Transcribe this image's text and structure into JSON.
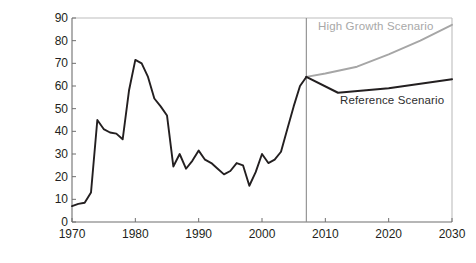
{
  "axes": {
    "ylabel": "dollars per barrel (2006)",
    "yticks": [
      0,
      10,
      20,
      30,
      40,
      50,
      60,
      70,
      80,
      90
    ],
    "xticks": [
      1970,
      1980,
      1990,
      2000,
      2010,
      2020,
      2030
    ]
  },
  "annotations": {
    "high_growth": "High Growth Scenario",
    "reference": "Reference Scenario"
  },
  "colors": {
    "historical_line": "#231f20",
    "reference_line": "#231f20",
    "high_growth_line": "#a6a6a6",
    "frame": "#bdbdbd",
    "divider": "#8c8c8c",
    "text": "#231f20",
    "high_growth_text": "#a8a8a8"
  },
  "chart_data": {
    "type": "line",
    "title": "",
    "xlabel": "",
    "ylabel": "dollars per barrel (2006)",
    "xlim": [
      1970,
      2030
    ],
    "ylim": [
      0,
      90
    ],
    "grid": false,
    "legend": "inline-annotations",
    "divider_year": 2007,
    "series": [
      {
        "name": "Historical",
        "color": "#231f20",
        "x": [
          1970,
          1971,
          1972,
          1973,
          1974,
          1975,
          1976,
          1977,
          1978,
          1979,
          1980,
          1981,
          1982,
          1983,
          1984,
          1985,
          1986,
          1987,
          1988,
          1989,
          1990,
          1991,
          1992,
          1993,
          1994,
          1995,
          1996,
          1997,
          1998,
          1999,
          2000,
          2001,
          2002,
          2003,
          2004,
          2005,
          2006,
          2007
        ],
        "values": [
          7,
          8,
          8.5,
          13,
          45,
          41,
          39.5,
          39,
          36.5,
          58,
          71.5,
          70,
          64,
          54.5,
          51,
          47,
          24.5,
          30,
          23.5,
          27,
          31.5,
          27.5,
          26,
          23.5,
          21,
          22.5,
          26,
          25,
          16,
          22,
          30,
          26,
          27.5,
          31,
          41,
          51,
          60,
          64
        ]
      },
      {
        "name": "Reference Scenario",
        "color": "#231f20",
        "x": [
          2007,
          2012,
          2020,
          2030
        ],
        "values": [
          64,
          57,
          59,
          63
        ]
      },
      {
        "name": "High Growth Scenario",
        "color": "#a6a6a6",
        "x": [
          2007,
          2010,
          2015,
          2020,
          2025,
          2030
        ],
        "values": [
          64,
          65.5,
          68.5,
          74,
          80,
          87
        ]
      }
    ]
  }
}
